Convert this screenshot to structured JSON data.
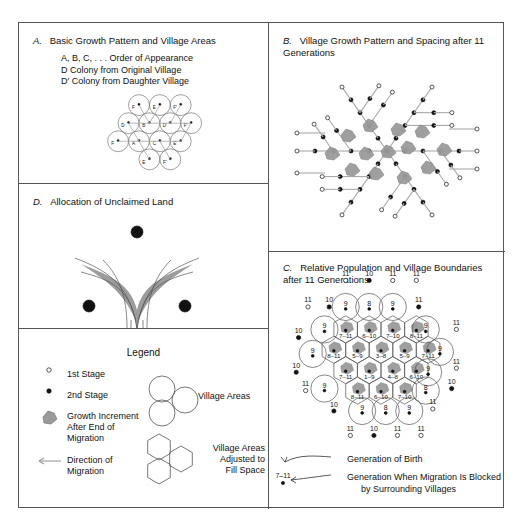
{
  "figure": {
    "panels": {
      "A": {
        "letter": "A.",
        "title": "Basic Growth Pattern and Village Areas",
        "notes": [
          "A, B, C, . . . Order of Appearance",
          "D Colony from Original Village",
          "D′ Colony from Daughter Village"
        ],
        "circles": [
          {
            "label": "F",
            "cx": 118,
            "cy": 118,
            "r": 15
          },
          {
            "label": "E",
            "cx": 148,
            "cy": 118,
            "r": 15
          },
          {
            "label": "F′",
            "cx": 178,
            "cy": 118,
            "r": 15
          },
          {
            "label": "D",
            "cx": 103,
            "cy": 144,
            "r": 15
          },
          {
            "label": "B",
            "cx": 133,
            "cy": 144,
            "r": 15
          },
          {
            "label": "D′",
            "cx": 163,
            "cy": 144,
            "r": 15
          },
          {
            "label": "F′",
            "cx": 193,
            "cy": 144,
            "r": 15
          },
          {
            "label": "F",
            "cx": 88,
            "cy": 170,
            "r": 15
          },
          {
            "label": "A",
            "cx": 118,
            "cy": 170,
            "r": 15
          },
          {
            "label": "C",
            "cx": 148,
            "cy": 170,
            "r": 15
          },
          {
            "label": "E′",
            "cx": 178,
            "cy": 170,
            "r": 15
          },
          {
            "label": "E",
            "cx": 133,
            "cy": 196,
            "r": 15
          },
          {
            "label": "F′",
            "cx": 163,
            "cy": 196,
            "r": 15
          }
        ]
      },
      "B": {
        "letter": "B.",
        "title": "Village Growth Pattern and Spacing after 11 Generations"
      },
      "C": {
        "letter": "C.",
        "title": "Relative Population and Village Boundaries after 11 Generations",
        "hex_rows": [
          [
            "7–11",
            "6–10",
            "7–10",
            "8–11"
          ],
          [
            "8–11",
            "5–9",
            "3–8",
            "5–9",
            "7–11"
          ],
          [
            "7–11",
            "1–9",
            "4–8",
            "6–10"
          ],
          [
            "8–11",
            "6–10",
            "7–10"
          ]
        ],
        "ring_circle_values": {
          "row_top_outer": [
            "11",
            "10",
            "11",
            "11"
          ],
          "row2": [
            "11",
            "10",
            "9",
            "8",
            "9",
            "11"
          ],
          "row3": [
            "10",
            "9",
            "9",
            "11"
          ],
          "row4": [
            "10",
            "10",
            "11"
          ],
          "row5": [
            "11",
            "9",
            "8",
            "10"
          ],
          "row6": [
            "10",
            "9",
            "8",
            "9",
            "11"
          ],
          "row_bottom_outer": [
            "11",
            "10",
            "11",
            "11"
          ]
        },
        "caption_lines": [
          "Generation of Birth",
          "Generation When Migration Is Blocked",
          "by Surrounding Villages"
        ],
        "caption_marker": "7–11"
      },
      "D": {
        "letter": "D.",
        "title": "Allocation of Unclaimed Land"
      }
    },
    "legend": {
      "title": "Legend",
      "items": [
        {
          "icon": "open-circle-icon",
          "label": "1st Stage"
        },
        {
          "icon": "filled-dot-icon",
          "label": "2nd Stage"
        },
        {
          "icon": "gray-blob-icon",
          "label": "Growth Increment\nAfter End of\nMigration"
        },
        {
          "icon": "arrow-left-icon",
          "label": "Direction of\nMigration"
        }
      ],
      "right_items": [
        {
          "icon": "three-circles-icon",
          "label": "Village Areas"
        },
        {
          "icon": "three-hexagons-icon",
          "label": "Village Areas\nAdjusted to\nFill Space"
        }
      ]
    },
    "colors": {
      "stroke": "#555555",
      "ink": "#111111",
      "gray_fill": "#9a9a9a",
      "light_line": "#aaaaaa"
    }
  }
}
